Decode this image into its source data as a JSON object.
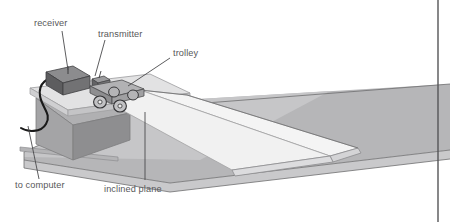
{
  "figure": {
    "background_color": "#ffffff",
    "border_color": "#555557",
    "labels": {
      "receiver": "receiver",
      "transmitter": "transmitter",
      "trolley": "trolley",
      "to_computer": "to computer",
      "inclined_plane": "inclined plane"
    },
    "label_color": "#58585a",
    "parts": {
      "receiver_box": {
        "name": "receiver",
        "top_color": "#8a8a8c",
        "front_color": "#636365",
        "side_color": "#4e4e50"
      },
      "transmitter_box": {
        "name": "transmitter",
        "top_color": "#9a9a9c",
        "front_color": "#6e6e70"
      },
      "trolley": {
        "name": "trolley",
        "body_color": "#a8a8aa",
        "body_shadow_color": "#87878a",
        "wheel_count": 4,
        "wheel_color": "#b8b8ba",
        "wheel_rim_color": "#3a3a3c"
      },
      "support_block": {
        "name": "support-block",
        "top_color": "#b0b0b2",
        "front_color": "#a0a0a2",
        "side_color": "#8c8c8e"
      },
      "ramp": {
        "name": "inclined-plane",
        "top_color": "#f2f2f2",
        "edge_color": "#c8c8ca",
        "side_color": "#d8d8da"
      },
      "bench": {
        "name": "bench-surface",
        "top_color": "#b6b6b8",
        "front_color": "#c9c9cb",
        "edge_color": "#9a9a9c"
      },
      "cable": {
        "name": "cable-to-computer",
        "color": "#1a1a1a"
      }
    }
  }
}
